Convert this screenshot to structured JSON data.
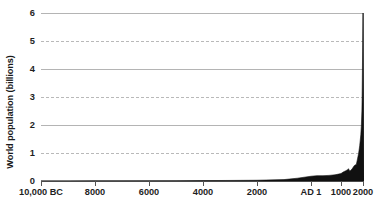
{
  "chart_data": {
    "type": "area",
    "title": "",
    "xlabel": "",
    "ylabel": "World population (billions)",
    "ylim": [
      0,
      6
    ],
    "yticks": [
      0,
      1,
      2,
      3,
      4,
      5,
      6
    ],
    "ytick_labels": [
      "0",
      "1",
      "2",
      "3",
      "4",
      "5",
      "6"
    ],
    "xtick_labels": [
      "10,000 BC",
      "8000",
      "6000",
      "4000",
      "2000",
      "AD 1",
      "1000",
      "2000"
    ],
    "xtick_years": [
      -10000,
      -8000,
      -6000,
      -4000,
      -2000,
      1,
      1000,
      2000
    ],
    "xtick_px": [
      0,
      54,
      108,
      162,
      216,
      270,
      300,
      322
    ],
    "grid": {
      "solid_at": [
        2,
        4,
        6
      ],
      "dashed_at": [
        1,
        3,
        5
      ],
      "axis_at": [
        0
      ]
    },
    "legend": null,
    "annotations": [],
    "series_name": "World population",
    "series_color": "#111111",
    "grid_color": "#b4b4b4",
    "axis_color": "#4a4a4a",
    "text_color": "#1f1f1f",
    "x": [
      -10000,
      -9000,
      -8000,
      -7000,
      -6000,
      -5000,
      -4000,
      -3000,
      -2000,
      -1000,
      -500,
      1,
      200,
      400,
      600,
      800,
      1000,
      1100,
      1200,
      1300,
      1340,
      1400,
      1500,
      1600,
      1700,
      1750,
      1800,
      1850,
      1900,
      1927,
      1950,
      1960,
      1974,
      1987,
      1999,
      2000
    ],
    "values": [
      0.004,
      0.004,
      0.005,
      0.005,
      0.007,
      0.01,
      0.015,
      0.02,
      0.027,
      0.05,
      0.1,
      0.17,
      0.19,
      0.19,
      0.2,
      0.22,
      0.265,
      0.32,
      0.36,
      0.4,
      0.44,
      0.35,
      0.425,
      0.545,
      0.6,
      0.79,
      0.98,
      1.26,
      1.65,
      2.0,
      2.5,
      3.0,
      4.0,
      5.0,
      6.0,
      6.1
    ]
  }
}
